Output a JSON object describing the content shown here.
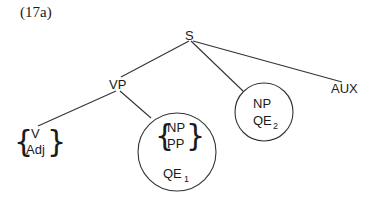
{
  "figure": {
    "label": "(17a)"
  },
  "tree": {
    "root": "S",
    "nodes": {
      "s": "S",
      "vp": "VP",
      "aux": "AUX",
      "v": "V",
      "adj": "Adj",
      "qe1_np": "NP",
      "qe1_pp": "PP",
      "qe1_label": "QE",
      "qe1_sub": "1",
      "qe2_np": "NP",
      "qe2_label": "QE",
      "qe2_sub": "2"
    },
    "edges": [
      {
        "from": "S",
        "to": "VP"
      },
      {
        "from": "S",
        "to": "QE2-circle"
      },
      {
        "from": "S",
        "to": "AUX"
      },
      {
        "from": "VP",
        "to": "V/Adj"
      },
      {
        "from": "VP",
        "to": "QE1-circle"
      }
    ],
    "brace_left": "{",
    "brace_right": "}"
  }
}
